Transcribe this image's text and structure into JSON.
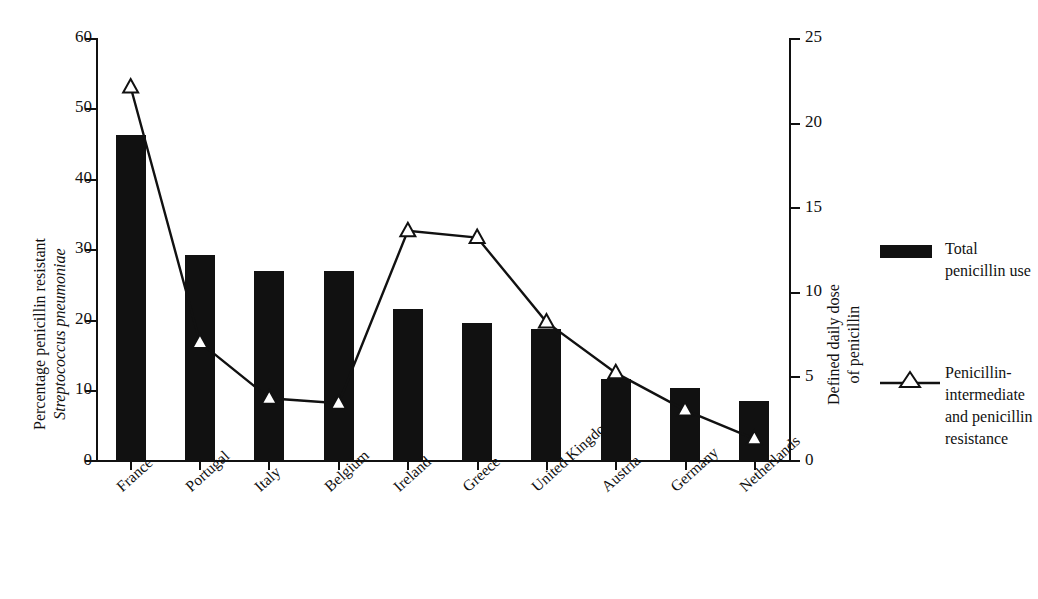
{
  "chart_data": {
    "type": "bar",
    "title": "",
    "categories": [
      "France",
      "Portugal",
      "Italy",
      "Belgium",
      "Ireland",
      "Greece",
      "United Kingdom",
      "Austria",
      "Germany",
      "Netherlands"
    ],
    "series": [
      {
        "name": "Total penicillin use",
        "axis": "left",
        "render": "bar",
        "values": [
          46.2,
          29.2,
          27.0,
          27.0,
          21.5,
          19.5,
          18.7,
          11.6,
          10.4,
          8.5
        ]
      },
      {
        "name": "Penicillin-intermediate and penicillin resistance",
        "axis": "right",
        "render": "line",
        "values": [
          22.1,
          7.0,
          3.7,
          3.4,
          13.6,
          13.2,
          8.2,
          5.2,
          3.0,
          1.3
        ]
      }
    ],
    "ylabel": "Percentage penicillin resistant Streptococcus pneumoniae",
    "ylabel_right": "Defined daily dose of penicillin",
    "xlabel": "",
    "ylim": [
      0,
      60
    ],
    "ylim_right": [
      0,
      25
    ],
    "yticks": [
      0,
      10,
      20,
      30,
      40,
      50,
      60
    ],
    "yticks_right": [
      0,
      5,
      10,
      15,
      20,
      25
    ],
    "grid": false,
    "legend_position": "right"
  },
  "axes": {
    "left": {
      "title_line1": "Percentage penicillin resistant",
      "title_line2": "Streptococcus pneumoniae",
      "ticks": [
        "60",
        "50",
        "40",
        "30",
        "20",
        "10",
        "0"
      ]
    },
    "right": {
      "title_line1": "Defined daily dose",
      "title_line2": "of penicillin",
      "ticks": [
        "25",
        "20",
        "15",
        "10",
        "5",
        "0"
      ]
    },
    "x": {
      "labels": [
        "France",
        "Portugal",
        "Italy",
        "Belgium",
        "Ireland",
        "Greece",
        "United Kingdom",
        "Austria",
        "Germany",
        "Netherlands"
      ]
    }
  },
  "legend": {
    "items": [
      {
        "key": "bar",
        "label": "Total\npenicillin use"
      },
      {
        "key": "line",
        "label": "Penicillin-\nintermediate\nand penicillin\nresistance"
      }
    ]
  },
  "colors": {
    "ink": "#111111",
    "background": "#ffffff",
    "marker_fill": "#ffffff"
  }
}
